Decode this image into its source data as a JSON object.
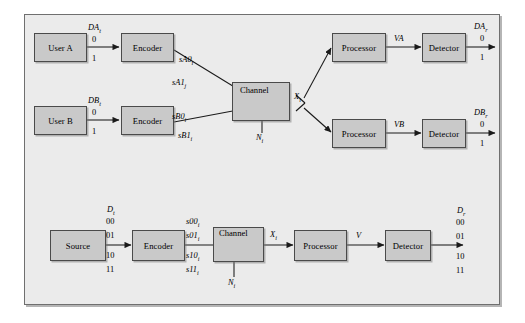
{
  "figure": {
    "kind": "block-diagram",
    "panels": [
      {
        "id": "two-user-mac",
        "blocks": [
          {
            "name": "user-a",
            "label": "User A"
          },
          {
            "name": "encoder-a",
            "label": "Encoder"
          },
          {
            "name": "user-b",
            "label": "User B"
          },
          {
            "name": "encoder-b",
            "label": "Encoder"
          },
          {
            "name": "channel",
            "label": "Channel"
          },
          {
            "name": "processor-a",
            "label": "Processor"
          },
          {
            "name": "detector-a",
            "label": "Detector"
          },
          {
            "name": "processor-b",
            "label": "Processor"
          },
          {
            "name": "detector-b",
            "label": "Detector"
          }
        ],
        "signals": {
          "da_t": "DA",
          "da_t_sub": "t",
          "da_t_values": [
            "0",
            "1"
          ],
          "db_t": "DB",
          "db_t_sub": "t",
          "db_t_values": [
            "0",
            "1"
          ],
          "sa0": "sA0",
          "sa0_sub": "i",
          "sa1": "sA1",
          "sa1_sub": "j",
          "sb0": "sB0",
          "sb0_sub": "i",
          "sb1": "sB1",
          "sb1_sub": "i",
          "x_i": "X",
          "x_i_sub": "i",
          "n_i": "N",
          "n_i_sub": "i",
          "va": "VA",
          "vb": "VB",
          "da_r": "DA",
          "da_r_sub": "r",
          "da_r_values": [
            "0",
            "1"
          ],
          "db_r": "DB",
          "db_r_sub": "r",
          "db_r_values": [
            "0",
            "1"
          ],
          "sum_glyph": "+"
        }
      },
      {
        "id": "single-user-4ary",
        "blocks": [
          {
            "name": "source",
            "label": "Source"
          },
          {
            "name": "encoder",
            "label": "Encoder"
          },
          {
            "name": "channel",
            "label": "Channel"
          },
          {
            "name": "processor",
            "label": "Processor"
          },
          {
            "name": "detector",
            "label": "Detector"
          }
        ],
        "signals": {
          "d_t": "D",
          "d_t_sub": "t",
          "d_t_values": [
            "00",
            "01",
            "10",
            "11"
          ],
          "s00": "s00",
          "s00_sub": "i",
          "s01": "s01",
          "s01_sub": "i",
          "s10": "s10",
          "s10_sub": "i",
          "s11": "s11",
          "s11_sub": "i",
          "x_i": "X",
          "x_i_sub": "i",
          "n_i": "N",
          "n_i_sub": "i",
          "v": "V",
          "d_r": "D",
          "d_r_sub": "r",
          "d_r_values": [
            "00",
            "01",
            "10",
            "11"
          ],
          "sum_glyph": "+"
        }
      }
    ],
    "colors": {
      "page_background": "#ffffff",
      "panel_background": "#ebebeb",
      "block_fill": "#c9c9c9",
      "block_stroke": "#4a4a4a",
      "line": "#1a1a1a"
    }
  }
}
